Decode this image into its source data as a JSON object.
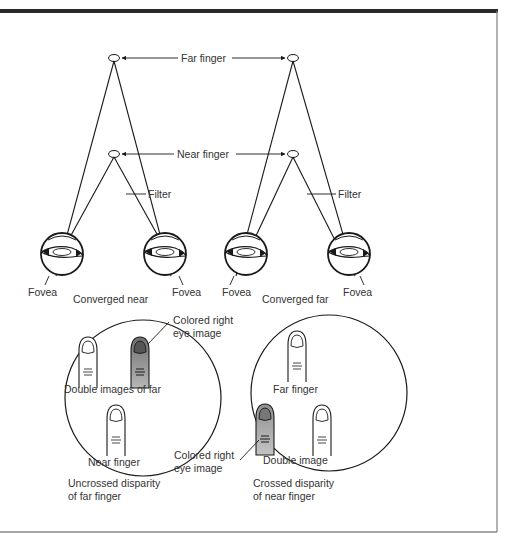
{
  "figure": {
    "type": "diagram",
    "colors": {
      "frame_top": "#2a2a2a",
      "frame_side": "#8a8a8a",
      "line": "#1a1a1a",
      "text": "#333333",
      "colored_finger": "#8c8c8c",
      "colored_finger_light": "#b5b5b5"
    }
  },
  "top": {
    "far_finger_label": "Far finger",
    "near_finger_label": "Near finger",
    "filter_label_left": "Filter",
    "filter_label_right": "Filter"
  },
  "left_panel": {
    "fovea_left": "Fovea",
    "fovea_right": "Fovea",
    "caption": "Converged near",
    "view": {
      "colored_label_line1": "Colored right",
      "colored_label_line2": "eye image",
      "double_images_label": "Double images of far",
      "near_finger_label": "Near finger",
      "caption_line1": "Uncrossed disparity",
      "caption_line2": "of far finger"
    }
  },
  "right_panel": {
    "fovea_left": "Fovea",
    "fovea_right": "Fovea",
    "caption": "Converged far",
    "view": {
      "far_finger_label": "Far finger",
      "colored_label_line1": "Colored right",
      "colored_label_line2": "eye image",
      "double_image_label": "Double image",
      "caption_line1": "Crossed disparity",
      "caption_line2": "of near finger"
    }
  }
}
